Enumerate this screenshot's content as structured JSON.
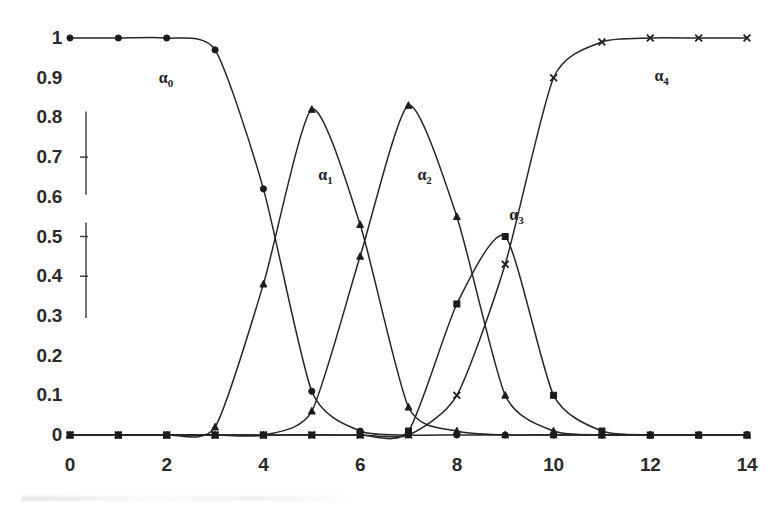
{
  "chart_data": {
    "type": "line",
    "title": "",
    "subtitle": "",
    "xlabel": "",
    "ylabel": "",
    "xlim": [
      0,
      14
    ],
    "ylim": [
      0,
      1
    ],
    "grid": false,
    "legend_position": "inline-annotations",
    "x": [
      0,
      1,
      2,
      3,
      4,
      5,
      6,
      7,
      8,
      9,
      10,
      11,
      12,
      13,
      14
    ],
    "x_tick_labels": [
      "0",
      "2",
      "4",
      "6",
      "8",
      "10",
      "12",
      "14"
    ],
    "x_tick_values": [
      0,
      2,
      4,
      6,
      8,
      10,
      12,
      14
    ],
    "y_tick_labels": [
      "0",
      "0.1",
      "0.2",
      "0.3",
      "0.4",
      "0.5",
      "0.6",
      "0.7",
      "0.8",
      "0.9",
      "1"
    ],
    "y_tick_values": [
      0,
      0.1,
      0.2,
      0.3,
      0.4,
      0.5,
      0.6,
      0.7,
      0.8,
      0.9,
      1
    ],
    "series": [
      {
        "name": "alpha_0",
        "label": "α",
        "subscript": "0",
        "marker": "circle",
        "color": "#1c1c1c",
        "values": [
          1.0,
          1.0,
          1.0,
          0.97,
          0.62,
          0.11,
          0.01,
          0.0,
          0.0,
          0.0,
          0.0,
          0.0,
          0.0,
          0.0,
          0.0
        ]
      },
      {
        "name": "alpha_1",
        "label": "α",
        "subscript": "1",
        "marker": "triangle",
        "color": "#1c1c1c",
        "values": [
          0.0,
          0.0,
          0.0,
          0.02,
          0.38,
          0.82,
          0.53,
          0.07,
          0.01,
          0.0,
          0.0,
          0.0,
          0.0,
          0.0,
          0.0
        ]
      },
      {
        "name": "alpha_2",
        "label": "α",
        "subscript": "2",
        "marker": "triangle",
        "color": "#1c1c1c",
        "values": [
          0.0,
          0.0,
          0.0,
          0.0,
          0.0,
          0.06,
          0.45,
          0.83,
          0.55,
          0.1,
          0.01,
          0.0,
          0.0,
          0.0,
          0.0
        ]
      },
      {
        "name": "alpha_3",
        "label": "α",
        "subscript": "3",
        "marker": "square",
        "color": "#1c1c1c",
        "values": [
          0.0,
          0.0,
          0.0,
          0.0,
          0.0,
          0.0,
          0.0,
          0.01,
          0.33,
          0.5,
          0.1,
          0.01,
          0.0,
          0.0,
          0.0
        ]
      },
      {
        "name": "alpha_4",
        "label": "α",
        "subscript": "4",
        "marker": "cross",
        "color": "#1c1c1c",
        "values": [
          0.0,
          0.0,
          0.0,
          0.0,
          0.0,
          0.0,
          0.0,
          0.0,
          0.1,
          0.43,
          0.9,
          0.99,
          1.0,
          1.0,
          1.0
        ]
      }
    ],
    "annotations": [
      {
        "name": "alpha-0-label",
        "text": "α",
        "sub": "0",
        "x": 2.0,
        "y": 0.9
      },
      {
        "name": "alpha-1-label",
        "text": "α",
        "sub": "1",
        "x": 5.3,
        "y": 0.655
      },
      {
        "name": "alpha-2-label",
        "text": "α",
        "sub": "2",
        "x": 7.35,
        "y": 0.655
      },
      {
        "name": "alpha-3-label",
        "text": "α",
        "sub": "3",
        "x": 9.25,
        "y": 0.555
      },
      {
        "name": "alpha-4-label",
        "text": "α",
        "sub": "4",
        "x": 12.25,
        "y": 0.905
      }
    ]
  }
}
